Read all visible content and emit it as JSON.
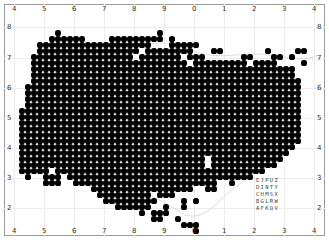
{
  "map": {
    "x_ticks_top": [
      "4",
      "5",
      "6",
      "7",
      "8",
      "9",
      "0",
      "1",
      "2",
      "3",
      "4"
    ],
    "x_ticks_bottom": [
      "4",
      "5",
      "6",
      "7",
      "8",
      "9",
      "0",
      "1",
      "2",
      "3",
      "4"
    ],
    "y_ticks_left": [
      "8",
      "7",
      "6",
      "5",
      "4",
      "3",
      "2"
    ],
    "y_ticks_right": [
      "8",
      "7",
      "6",
      "5",
      "4",
      "3",
      "2"
    ],
    "x_tick_positions": [
      12,
      42,
      72,
      102,
      132,
      162,
      192,
      222,
      252,
      282,
      312
    ],
    "y_tick_positions": [
      24,
      55,
      85,
      115,
      145,
      175,
      205
    ],
    "dot_color": "#000000",
    "grid_color": "#ececec",
    "frame_color": "#9a9a9a",
    "dot_pitch": 6,
    "dot_origin_x": 22,
    "dot_origin_y": 33,
    "rows": [
      [
        [
          6,
          6
        ],
        [
          23,
          23
        ]
      ],
      [
        [
          5,
          10
        ],
        [
          15,
          23
        ],
        [
          25,
          25
        ]
      ],
      [
        [
          3,
          21
        ],
        [
          25,
          29
        ]
      ],
      [
        [
          3,
          19
        ],
        [
          21,
          28
        ],
        [
          32,
          33
        ],
        [
          41,
          41
        ],
        [
          46,
          47
        ]
      ],
      [
        [
          2,
          18
        ],
        [
          20,
          26
        ],
        [
          28,
          30
        ],
        [
          37,
          38
        ],
        [
          42,
          43
        ],
        [
          45,
          45
        ]
      ],
      [
        [
          2,
          27
        ],
        [
          29,
          37
        ],
        [
          39,
          42
        ],
        [
          47,
          47
        ]
      ],
      [
        [
          2,
          45
        ]
      ],
      [
        [
          2,
          45
        ]
      ],
      [
        [
          2,
          46
        ]
      ],
      [
        [
          1,
          46
        ]
      ],
      [
        [
          1,
          46
        ]
      ],
      [
        [
          1,
          46
        ]
      ],
      [
        [
          1,
          46
        ]
      ],
      [
        [
          0,
          46
        ]
      ],
      [
        [
          0,
          46
        ]
      ],
      [
        [
          0,
          46
        ]
      ],
      [
        [
          0,
          46
        ]
      ],
      [
        [
          0,
          46
        ]
      ],
      [
        [
          0,
          46
        ]
      ],
      [
        [
          0,
          45
        ]
      ],
      [
        [
          0,
          44
        ]
      ],
      [
        [
          0,
          30
        ],
        [
          32,
          43
        ]
      ],
      [
        [
          0,
          30
        ],
        [
          32,
          42
        ]
      ],
      [
        [
          0,
          4
        ],
        [
          6,
          40
        ]
      ],
      [
        [
          1,
          1
        ],
        [
          4,
          6
        ],
        [
          8,
          38
        ]
      ],
      [
        [
          4,
          6
        ],
        [
          9,
          32
        ],
        [
          35,
          35
        ]
      ],
      [
        [
          12,
          28
        ],
        [
          31,
          32
        ]
      ],
      [
        [
          13,
          21
        ],
        [
          23,
          25
        ]
      ],
      [
        [
          14,
          22
        ],
        [
          27,
          27
        ],
        [
          29,
          29
        ]
      ],
      [
        [
          16,
          21
        ],
        [
          24,
          24
        ],
        [
          27,
          27
        ]
      ],
      [
        [
          20,
          20
        ],
        [
          22,
          24
        ]
      ],
      [
        [
          22,
          23
        ],
        [
          26,
          26
        ]
      ],
      [
        [
          27,
          29
        ]
      ],
      [
        [
          29,
          29
        ]
      ]
    ]
  },
  "legend": {
    "rows": [
      "EJPUZ",
      "DINTY",
      "CHMSX",
      "BGLRW",
      "AFKQV"
    ]
  }
}
